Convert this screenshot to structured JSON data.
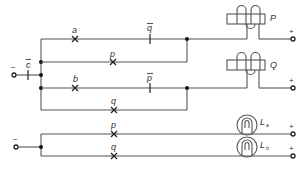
{
  "diagram": {
    "type": "switching-circuit",
    "input": {
      "label": "−",
      "contact_label": "c",
      "contact_negated": true
    },
    "upper_circuit": {
      "branch_1": {
        "series": [
          {
            "label": "a",
            "kind": "make-contact",
            "negated": false
          },
          {
            "label": "q",
            "kind": "break-contact",
            "negated": true
          }
        ],
        "parallel": {
          "label": "p",
          "kind": "make-contact",
          "negated": false
        },
        "output_relay": {
          "label": "P",
          "terminal": "+"
        }
      },
      "branch_2": {
        "series": [
          {
            "label": "b",
            "kind": "make-contact",
            "negated": false
          },
          {
            "label": "p",
            "kind": "break-contact",
            "negated": true
          }
        ],
        "parallel": {
          "label": "q",
          "kind": "make-contact",
          "negated": false
        },
        "output_relay": {
          "label": "Q",
          "terminal": "+"
        }
      }
    },
    "lower_circuit": {
      "input_label": "−",
      "lamps": [
        {
          "contact": "p",
          "lamp": "L",
          "subscript": "a",
          "terminal": "+"
        },
        {
          "contact": "q",
          "lamp": "L",
          "subscript": "b",
          "terminal": "+"
        }
      ]
    }
  }
}
